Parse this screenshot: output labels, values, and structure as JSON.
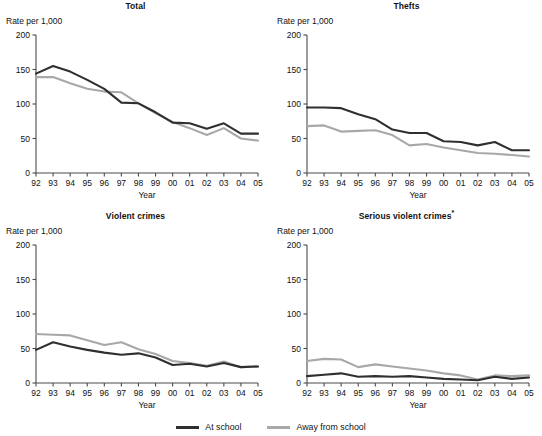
{
  "figure": {
    "panel_width": 271,
    "panel_height": 210,
    "axis_color": "#4a4a4a"
  },
  "legend": {
    "position": "bottom-center",
    "items": [
      {
        "label": "At school",
        "color": "#2f2f2f",
        "swatch": "dark"
      },
      {
        "label": "Away from school",
        "color": "#a8a8a8",
        "swatch": "light"
      }
    ]
  },
  "chart_data": [
    {
      "type": "line",
      "title": "Total",
      "title_note": "",
      "xlabel": "Year",
      "ylabel": "Rate per 1,000",
      "categories": [
        "92",
        "93",
        "94",
        "95",
        "96",
        "97",
        "98",
        "99",
        "00",
        "01",
        "02",
        "03",
        "04",
        "05"
      ],
      "yticks": [
        0,
        50,
        100,
        150,
        200
      ],
      "ylim": [
        0,
        200
      ],
      "grid": false,
      "legend_position": "figure-bottom",
      "series": [
        {
          "name": "At school",
          "color": "#2f2f2f",
          "values": [
            144,
            155,
            147,
            135,
            122,
            102,
            101,
            88,
            73,
            72,
            64,
            72,
            57,
            57
          ]
        },
        {
          "name": "Away from school",
          "color": "#a8a8a8",
          "values": [
            139,
            139,
            130,
            122,
            118,
            117,
            101,
            87,
            74,
            65,
            55,
            65,
            50,
            47
          ]
        }
      ]
    },
    {
      "type": "line",
      "title": "Thefts",
      "title_note": "",
      "xlabel": "Year",
      "ylabel": "Rate per 1,000",
      "categories": [
        "92",
        "93",
        "94",
        "95",
        "96",
        "97",
        "98",
        "99",
        "00",
        "01",
        "02",
        "03",
        "04",
        "05"
      ],
      "yticks": [
        0,
        50,
        100,
        150,
        200
      ],
      "ylim": [
        0,
        200
      ],
      "grid": false,
      "legend_position": "figure-bottom",
      "series": [
        {
          "name": "At school",
          "color": "#2f2f2f",
          "values": [
            95,
            95,
            94,
            85,
            78,
            63,
            58,
            58,
            46,
            45,
            40,
            45,
            33,
            33
          ]
        },
        {
          "name": "Away from school",
          "color": "#a8a8a8",
          "values": [
            68,
            69,
            60,
            61,
            62,
            55,
            40,
            42,
            37,
            33,
            29,
            28,
            26,
            24
          ]
        }
      ]
    },
    {
      "type": "line",
      "title": "Violent crimes",
      "title_note": "",
      "xlabel": "Year",
      "ylabel": "Rate per 1,000",
      "categories": [
        "92",
        "93",
        "94",
        "95",
        "96",
        "97",
        "98",
        "99",
        "00",
        "01",
        "02",
        "03",
        "04",
        "05"
      ],
      "yticks": [
        0,
        50,
        100,
        150,
        200
      ],
      "ylim": [
        0,
        200
      ],
      "grid": false,
      "legend_position": "figure-bottom",
      "series": [
        {
          "name": "At school",
          "color": "#2f2f2f",
          "values": [
            48,
            59,
            53,
            48,
            44,
            41,
            43,
            37,
            26,
            28,
            24,
            29,
            23,
            24
          ]
        },
        {
          "name": "Away from school",
          "color": "#a8a8a8",
          "values": [
            71,
            70,
            69,
            62,
            55,
            59,
            49,
            42,
            32,
            29,
            25,
            31,
            23,
            24
          ]
        }
      ]
    },
    {
      "type": "line",
      "title": "Serious violent crimes",
      "title_note": "*",
      "xlabel": "Year",
      "ylabel": "Rate per 1,000",
      "categories": [
        "92",
        "93",
        "94",
        "95",
        "96",
        "97",
        "98",
        "99",
        "00",
        "01",
        "02",
        "03",
        "04",
        "05"
      ],
      "yticks": [
        0,
        50,
        100,
        150,
        200
      ],
      "ylim": [
        0,
        200
      ],
      "grid": false,
      "legend_position": "figure-bottom",
      "series": [
        {
          "name": "At school",
          "color": "#2f2f2f",
          "values": [
            10,
            12,
            14,
            9,
            10,
            9,
            10,
            8,
            6,
            5,
            4,
            9,
            6,
            8
          ]
        },
        {
          "name": "Away from school",
          "color": "#a8a8a8",
          "values": [
            32,
            35,
            34,
            23,
            27,
            24,
            21,
            18,
            14,
            11,
            5,
            11,
            10,
            11
          ]
        }
      ]
    }
  ]
}
